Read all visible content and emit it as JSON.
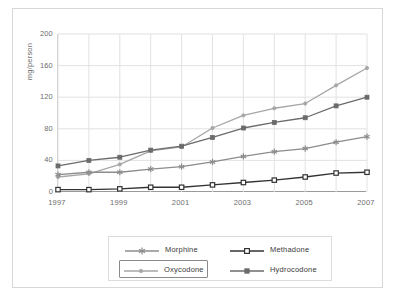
{
  "chart_data": {
    "type": "line",
    "title": "",
    "xlabel": "",
    "ylabel": "mg/person",
    "x": [
      1997,
      1998,
      1999,
      2000,
      2001,
      2002,
      2003,
      2004,
      2005,
      2006,
      2007
    ],
    "xticklabels": [
      "1997",
      "1999",
      "2001",
      "2003",
      "2005",
      "2007"
    ],
    "xtickvalues": [
      1997,
      1999,
      2001,
      2003,
      2005,
      2007
    ],
    "yticklabels": [
      "0",
      "40",
      "80",
      "120",
      "160",
      "200"
    ],
    "ytickvalues": [
      0,
      40,
      80,
      120,
      160,
      200
    ],
    "xlim": [
      1997,
      2007
    ],
    "ylim": [
      0,
      200
    ],
    "grid": true,
    "legend_position": "bottom",
    "series": [
      {
        "name": "Morphine",
        "marker": "asterisk",
        "color": "#8c8c8c",
        "values": [
          22,
          25,
          25,
          29,
          32,
          38,
          45,
          51,
          55,
          63,
          70
        ]
      },
      {
        "name": "Methadone",
        "marker": "open-square",
        "color": "#333333",
        "values": [
          3,
          3,
          4,
          6,
          6,
          9,
          12,
          15,
          19,
          24,
          25
        ]
      },
      {
        "name": "Oxycodone",
        "marker": "small-dot",
        "color": "#a6a6a6",
        "values": [
          19,
          23,
          35,
          52,
          57,
          81,
          97,
          106,
          112,
          135,
          157
        ],
        "selected": true
      },
      {
        "name": "Hydrocodone",
        "marker": "filled-square",
        "color": "#6b6b6b",
        "values": [
          33,
          40,
          44,
          53,
          58,
          69,
          81,
          88,
          94,
          109,
          120
        ]
      }
    ]
  },
  "axis": {
    "ylabel": "mg/person"
  },
  "legend": {
    "items": [
      {
        "label": "Morphine",
        "marker": "asterisk-marker-icon",
        "selected": false
      },
      {
        "label": "Methadone",
        "marker": "open-square-marker-icon",
        "selected": false
      },
      {
        "label": "Oxycodone",
        "marker": "dot-marker-icon",
        "selected": true
      },
      {
        "label": "Hydrocodone",
        "marker": "filled-square-marker-icon",
        "selected": false
      }
    ]
  },
  "colors": {
    "morphine": "#8c8c8c",
    "methadone": "#333333",
    "oxycodone": "#a6a6a6",
    "hydrocodone": "#6b6b6b",
    "grid": "#e2e2e2",
    "axis": "#9a9a9a",
    "text": "#6e6e6e",
    "frame": "#d8d8d8"
  }
}
